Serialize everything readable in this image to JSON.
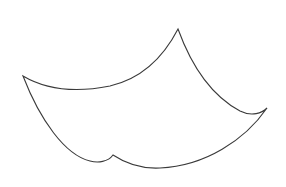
{
  "drawing": {
    "subject": "curved-cloth-shape",
    "description": "Line drawing of a four-cornered curved sheet (like a flying carpet or cloth)",
    "stroke_color": "#3a3a3a",
    "fill_color": "#ffffff",
    "background_color": "#ffffff",
    "vertices": {
      "left_tip": [
        23,
        76
      ],
      "top_tip": [
        178,
        29
      ],
      "right_tip": [
        267,
        108
      ],
      "bottom_notch": [
        113,
        155
      ]
    }
  }
}
